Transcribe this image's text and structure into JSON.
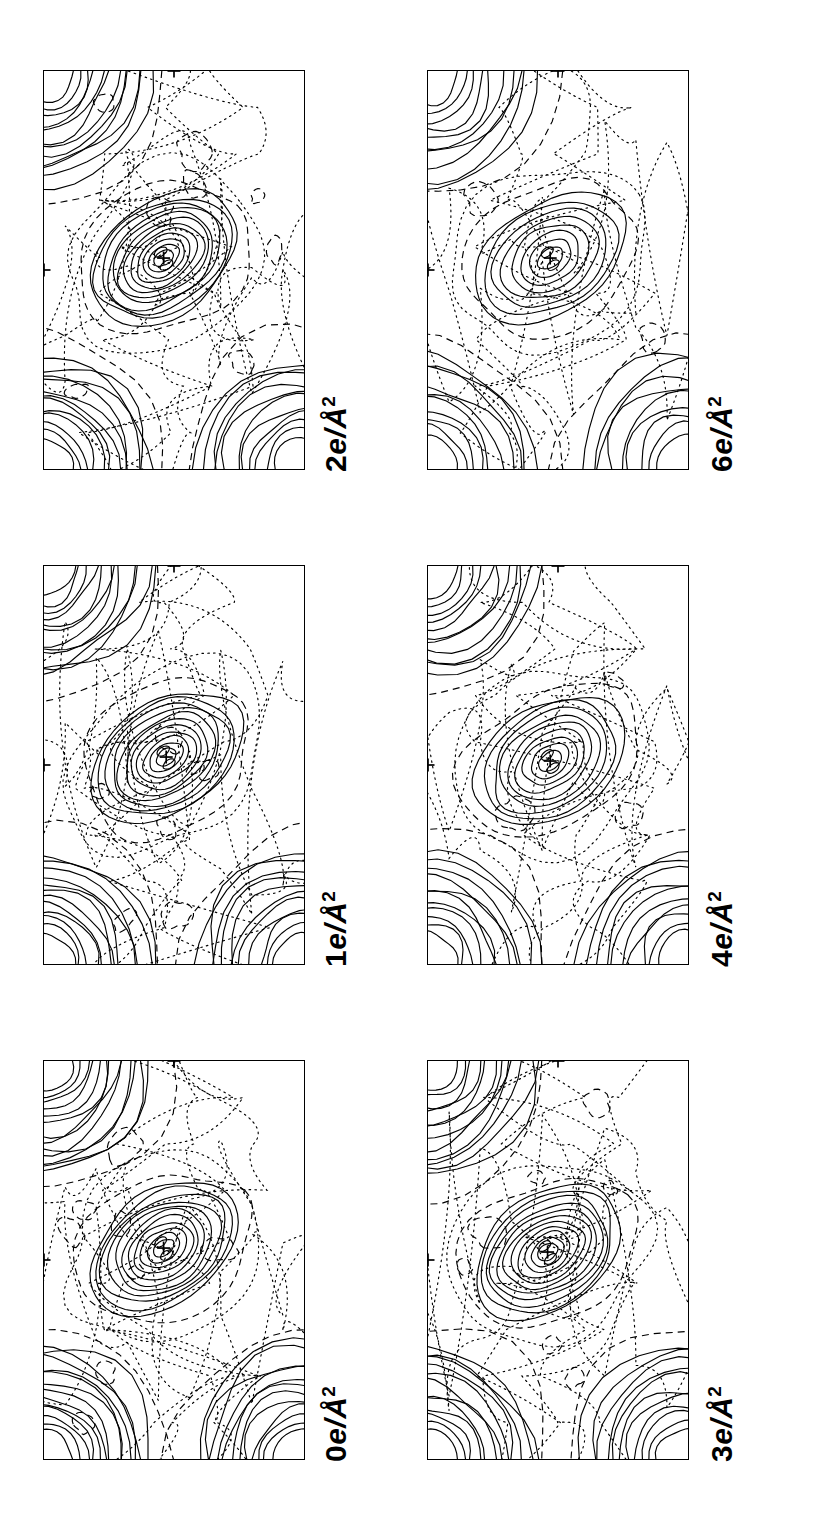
{
  "figure": {
    "orientation": "rotated-90",
    "rows": 2,
    "columns": 3,
    "contour_legend": {
      "positive": "solid",
      "negative": "dashed",
      "zero": "dotted"
    },
    "marker": "+"
  },
  "panels": [
    {
      "id": "panel-0",
      "label_value": "0",
      "label_units": "e/Å",
      "label_exponent": "2",
      "label": "0 e/Å2",
      "row": 1,
      "column": 1
    },
    {
      "id": "panel-1",
      "label_value": "1",
      "label_units": "e/Å",
      "label_exponent": "2",
      "label": "1 e/Å2",
      "row": 1,
      "column": 2
    },
    {
      "id": "panel-2",
      "label_value": "2",
      "label_units": "e/Å",
      "label_exponent": "2",
      "label": "2 e/Å2",
      "row": 1,
      "column": 3
    },
    {
      "id": "panel-3",
      "label_value": "3",
      "label_units": "e/Å",
      "label_exponent": "2",
      "label": "3 e/Å2",
      "row": 2,
      "column": 1
    },
    {
      "id": "panel-4",
      "label_value": "4",
      "label_units": "e/Å",
      "label_exponent": "2",
      "label": "4 e/Å2",
      "row": 2,
      "column": 2
    },
    {
      "id": "panel-5",
      "label_value": "6",
      "label_units": "e/Å",
      "label_exponent": "2",
      "label": "6 e/Å2",
      "row": 2,
      "column": 3
    }
  ],
  "chart_data": {
    "type": "heatmap",
    "subtype": "contour-map-grid",
    "xlabel": "",
    "ylabel": "",
    "grid": false,
    "legend_position": "none",
    "panel_labels": [
      "0 e/Å2",
      "1 e/Å2",
      "2 e/Å2",
      "3 e/Å2",
      "4 e/Å2",
      "6 e/Å2"
    ],
    "contour_interval": 1,
    "contour_units": "e/Å^2",
    "line_styles": {
      "positive": "solid",
      "negative": "dashed",
      "zero": "dotted"
    },
    "series": [
      {
        "name": "0 e/Å2",
        "peaks": [
          {
            "name": "corner-peak-top-left",
            "x": 0.0,
            "y": 0.0,
            "levels": 13
          },
          {
            "name": "corner-peak-bottom-left",
            "x": 0.0,
            "y": 1.0,
            "levels": 13
          },
          {
            "name": "corner-peak-bottom-right",
            "x": 1.0,
            "y": 1.0,
            "levels": 12
          },
          {
            "name": "central-bond-peak",
            "x": 0.46,
            "y": 0.47,
            "levels": 11
          }
        ],
        "atom_markers": [
          {
            "x": 0.46,
            "y": 0.47
          },
          {
            "x": 0.5,
            "y": 0.0
          },
          {
            "x": 0.0,
            "y": 0.5
          }
        ],
        "negative_pockets": 8
      },
      {
        "name": "1 e/Å2",
        "peaks": [
          {
            "name": "corner-peak-top-left",
            "x": 0.0,
            "y": 0.0,
            "levels": 12
          },
          {
            "name": "corner-peak-bottom-left",
            "x": 0.0,
            "y": 1.0,
            "levels": 12
          },
          {
            "name": "corner-peak-bottom-right",
            "x": 1.0,
            "y": 1.0,
            "levels": 11
          },
          {
            "name": "central-bond-peak",
            "x": 0.47,
            "y": 0.48,
            "levels": 11
          }
        ],
        "atom_markers": [
          {
            "x": 0.47,
            "y": 0.48
          },
          {
            "x": 0.5,
            "y": 0.0
          },
          {
            "x": 0.0,
            "y": 0.5
          }
        ],
        "negative_pockets": 7
      },
      {
        "name": "2 e/Å2",
        "peaks": [
          {
            "name": "corner-peak-top-left",
            "x": 0.0,
            "y": 0.0,
            "levels": 12
          },
          {
            "name": "corner-peak-bottom-left",
            "x": 0.0,
            "y": 1.0,
            "levels": 12
          },
          {
            "name": "corner-peak-bottom-right",
            "x": 1.0,
            "y": 1.0,
            "levels": 11
          },
          {
            "name": "central-bond-peak",
            "x": 0.46,
            "y": 0.47,
            "levels": 12
          }
        ],
        "atom_markers": [
          {
            "x": 0.46,
            "y": 0.47
          },
          {
            "x": 0.5,
            "y": 0.0
          },
          {
            "x": 0.0,
            "y": 0.5
          }
        ],
        "negative_pockets": 8
      },
      {
        "name": "3 e/Å2",
        "peaks": [
          {
            "name": "corner-peak-top-left",
            "x": 0.0,
            "y": 0.0,
            "levels": 12
          },
          {
            "name": "corner-peak-bottom-left",
            "x": 0.0,
            "y": 1.0,
            "levels": 12
          },
          {
            "name": "corner-peak-bottom-right",
            "x": 1.0,
            "y": 1.0,
            "levels": 11
          },
          {
            "name": "central-bond-peak",
            "x": 0.46,
            "y": 0.48,
            "levels": 11
          }
        ],
        "atom_markers": [
          {
            "x": 0.46,
            "y": 0.48
          },
          {
            "x": 0.5,
            "y": 0.0
          },
          {
            "x": 0.0,
            "y": 0.5
          }
        ],
        "negative_pockets": 7
      },
      {
        "name": "4 e/Å2",
        "peaks": [
          {
            "name": "corner-peak-top-left",
            "x": 0.0,
            "y": 0.0,
            "levels": 11
          },
          {
            "name": "corner-peak-bottom-left",
            "x": 0.0,
            "y": 1.0,
            "levels": 11
          },
          {
            "name": "corner-peak-bottom-right",
            "x": 1.0,
            "y": 1.0,
            "levels": 10
          },
          {
            "name": "central-bond-peak",
            "x": 0.47,
            "y": 0.49,
            "levels": 9
          }
        ],
        "atom_markers": [
          {
            "x": 0.47,
            "y": 0.49
          },
          {
            "x": 0.5,
            "y": 0.0
          },
          {
            "x": 0.0,
            "y": 0.5
          }
        ],
        "negative_pockets": 3
      },
      {
        "name": "6 e/Å2",
        "peaks": [
          {
            "name": "corner-peak-top-left",
            "x": 0.0,
            "y": 0.0,
            "levels": 10
          },
          {
            "name": "corner-peak-bottom-left",
            "x": 0.0,
            "y": 1.0,
            "levels": 10
          },
          {
            "name": "corner-peak-bottom-right",
            "x": 1.0,
            "y": 1.0,
            "levels": 9
          },
          {
            "name": "central-bond-peak",
            "x": 0.47,
            "y": 0.47,
            "levels": 8
          }
        ],
        "atom_markers": [
          {
            "x": 0.47,
            "y": 0.47
          },
          {
            "x": 0.5,
            "y": 0.0
          },
          {
            "x": 0.0,
            "y": 0.5
          }
        ],
        "negative_pockets": 2
      }
    ]
  }
}
